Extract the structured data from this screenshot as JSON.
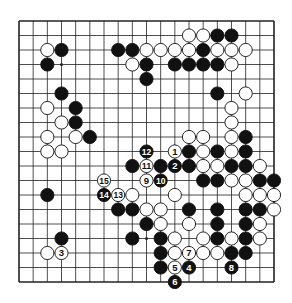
{
  "diagram": {
    "type": "go-board",
    "size": 19,
    "colors": {
      "black": "#111111",
      "white": "#ffffff",
      "line": "#222222",
      "background": "#ffffff"
    },
    "star_points": [
      [
        3,
        3
      ],
      [
        9,
        3
      ],
      [
        15,
        3
      ],
      [
        3,
        9
      ],
      [
        9,
        9
      ],
      [
        15,
        9
      ],
      [
        3,
        15
      ],
      [
        9,
        15
      ],
      [
        15,
        15
      ]
    ],
    "stones": [
      {
        "c": 12,
        "r": 1,
        "color": "W"
      },
      {
        "c": 13,
        "r": 1,
        "color": "W"
      },
      {
        "c": 14,
        "r": 1,
        "color": "B"
      },
      {
        "c": 15,
        "r": 1,
        "color": "B"
      },
      {
        "c": 2,
        "r": 2,
        "color": "W"
      },
      {
        "c": 3,
        "r": 2,
        "color": "B"
      },
      {
        "c": 7,
        "r": 2,
        "color": "B"
      },
      {
        "c": 8,
        "r": 2,
        "color": "B"
      },
      {
        "c": 9,
        "r": 2,
        "color": "W"
      },
      {
        "c": 10,
        "r": 2,
        "color": "W"
      },
      {
        "c": 11,
        "r": 2,
        "color": "W"
      },
      {
        "c": 12,
        "r": 2,
        "color": "W"
      },
      {
        "c": 13,
        "r": 2,
        "color": "B"
      },
      {
        "c": 14,
        "r": 2,
        "color": "W"
      },
      {
        "c": 15,
        "r": 2,
        "color": "W"
      },
      {
        "c": 16,
        "r": 2,
        "color": "W"
      },
      {
        "c": 2,
        "r": 3,
        "color": "B"
      },
      {
        "c": 8,
        "r": 3,
        "color": "W"
      },
      {
        "c": 9,
        "r": 3,
        "color": "B"
      },
      {
        "c": 11,
        "r": 3,
        "color": "B"
      },
      {
        "c": 12,
        "r": 3,
        "color": "B"
      },
      {
        "c": 13,
        "r": 3,
        "color": "B"
      },
      {
        "c": 14,
        "r": 3,
        "color": "B"
      },
      {
        "c": 15,
        "r": 3,
        "color": "W"
      },
      {
        "c": 9,
        "r": 4,
        "color": "B"
      },
      {
        "c": 3,
        "r": 5,
        "color": "B"
      },
      {
        "c": 14,
        "r": 5,
        "color": "B"
      },
      {
        "c": 16,
        "r": 5,
        "color": "W"
      },
      {
        "c": 2,
        "r": 6,
        "color": "W"
      },
      {
        "c": 4,
        "r": 6,
        "color": "B"
      },
      {
        "c": 15,
        "r": 6,
        "color": "W"
      },
      {
        "c": 3,
        "r": 7,
        "color": "W"
      },
      {
        "c": 4,
        "r": 7,
        "color": "B"
      },
      {
        "c": 15,
        "r": 7,
        "color": "W"
      },
      {
        "c": 2,
        "r": 8,
        "color": "W"
      },
      {
        "c": 4,
        "r": 8,
        "color": "W"
      },
      {
        "c": 5,
        "r": 8,
        "color": "B"
      },
      {
        "c": 12,
        "r": 8,
        "color": "W"
      },
      {
        "c": 13,
        "r": 8,
        "color": "W"
      },
      {
        "c": 15,
        "r": 8,
        "color": "W"
      },
      {
        "c": 16,
        "r": 8,
        "color": "B"
      },
      {
        "c": 2,
        "r": 9,
        "color": "W"
      },
      {
        "c": 3,
        "r": 9,
        "color": "W"
      },
      {
        "c": 9,
        "r": 9,
        "color": "B",
        "label": "12"
      },
      {
        "c": 11,
        "r": 9,
        "color": "W",
        "label": "1"
      },
      {
        "c": 12,
        "r": 9,
        "color": "B"
      },
      {
        "c": 13,
        "r": 9,
        "color": "W"
      },
      {
        "c": 14,
        "r": 9,
        "color": "B"
      },
      {
        "c": 15,
        "r": 9,
        "color": "W"
      },
      {
        "c": 16,
        "r": 9,
        "color": "B"
      },
      {
        "c": 8,
        "r": 10,
        "color": "B"
      },
      {
        "c": 9,
        "r": 10,
        "color": "W",
        "label": "11"
      },
      {
        "c": 10,
        "r": 10,
        "color": "B"
      },
      {
        "c": 11,
        "r": 10,
        "color": "B",
        "label": "2"
      },
      {
        "c": 12,
        "r": 10,
        "color": "B"
      },
      {
        "c": 13,
        "r": 10,
        "color": "W"
      },
      {
        "c": 14,
        "r": 10,
        "color": "W"
      },
      {
        "c": 15,
        "r": 10,
        "color": "B"
      },
      {
        "c": 16,
        "r": 10,
        "color": "B"
      },
      {
        "c": 17,
        "r": 10,
        "color": "W"
      },
      {
        "c": 6,
        "r": 11,
        "color": "W",
        "label": "15"
      },
      {
        "c": 9,
        "r": 11,
        "color": "W",
        "label": "9"
      },
      {
        "c": 10,
        "r": 11,
        "color": "B",
        "label": "10"
      },
      {
        "c": 13,
        "r": 11,
        "color": "B"
      },
      {
        "c": 14,
        "r": 11,
        "color": "B"
      },
      {
        "c": 15,
        "r": 11,
        "color": "W"
      },
      {
        "c": 16,
        "r": 11,
        "color": "W"
      },
      {
        "c": 17,
        "r": 11,
        "color": "B"
      },
      {
        "c": 18,
        "r": 11,
        "color": "B"
      },
      {
        "c": 2,
        "r": 12,
        "color": "B"
      },
      {
        "c": 6,
        "r": 12,
        "color": "B",
        "label": "14"
      },
      {
        "c": 7,
        "r": 12,
        "color": "W",
        "label": "13"
      },
      {
        "c": 8,
        "r": 12,
        "color": "W"
      },
      {
        "c": 11,
        "r": 12,
        "color": "W"
      },
      {
        "c": 16,
        "r": 12,
        "color": "W"
      },
      {
        "c": 17,
        "r": 12,
        "color": "W"
      },
      {
        "c": 18,
        "r": 12,
        "color": "W"
      },
      {
        "c": 7,
        "r": 13,
        "color": "B"
      },
      {
        "c": 8,
        "r": 13,
        "color": "B"
      },
      {
        "c": 9,
        "r": 13,
        "color": "W"
      },
      {
        "c": 10,
        "r": 13,
        "color": "W"
      },
      {
        "c": 12,
        "r": 13,
        "color": "B"
      },
      {
        "c": 14,
        "r": 13,
        "color": "B"
      },
      {
        "c": 16,
        "r": 13,
        "color": "B"
      },
      {
        "c": 17,
        "r": 13,
        "color": "B"
      },
      {
        "c": 18,
        "r": 13,
        "color": "W"
      },
      {
        "c": 9,
        "r": 14,
        "color": "B"
      },
      {
        "c": 10,
        "r": 14,
        "color": "W"
      },
      {
        "c": 12,
        "r": 14,
        "color": "W"
      },
      {
        "c": 14,
        "r": 14,
        "color": "B"
      },
      {
        "c": 16,
        "r": 14,
        "color": "B"
      },
      {
        "c": 17,
        "r": 14,
        "color": "W"
      },
      {
        "c": 3,
        "r": 15,
        "color": "B"
      },
      {
        "c": 8,
        "r": 15,
        "color": "B"
      },
      {
        "c": 10,
        "r": 15,
        "color": "B"
      },
      {
        "c": 11,
        "r": 15,
        "color": "W"
      },
      {
        "c": 13,
        "r": 15,
        "color": "W"
      },
      {
        "c": 14,
        "r": 15,
        "color": "B"
      },
      {
        "c": 15,
        "r": 15,
        "color": "W"
      },
      {
        "c": 16,
        "r": 15,
        "color": "B"
      },
      {
        "c": 17,
        "r": 15,
        "color": "W"
      },
      {
        "c": 2,
        "r": 16,
        "color": "W"
      },
      {
        "c": 3,
        "r": 16,
        "color": "W",
        "label": "3"
      },
      {
        "c": 10,
        "r": 16,
        "color": "B"
      },
      {
        "c": 11,
        "r": 16,
        "color": "W"
      },
      {
        "c": 12,
        "r": 16,
        "color": "W",
        "label": "7"
      },
      {
        "c": 13,
        "r": 16,
        "color": "W"
      },
      {
        "c": 14,
        "r": 16,
        "color": "W"
      },
      {
        "c": 15,
        "r": 16,
        "color": "B"
      },
      {
        "c": 16,
        "r": 16,
        "color": "B"
      },
      {
        "c": 10,
        "r": 17,
        "color": "B"
      },
      {
        "c": 11,
        "r": 17,
        "color": "W",
        "label": "5"
      },
      {
        "c": 12,
        "r": 17,
        "color": "B",
        "label": "4"
      },
      {
        "c": 15,
        "r": 17,
        "color": "B",
        "label": "8"
      },
      {
        "c": 11,
        "r": 18,
        "color": "B",
        "label": "6"
      }
    ]
  }
}
